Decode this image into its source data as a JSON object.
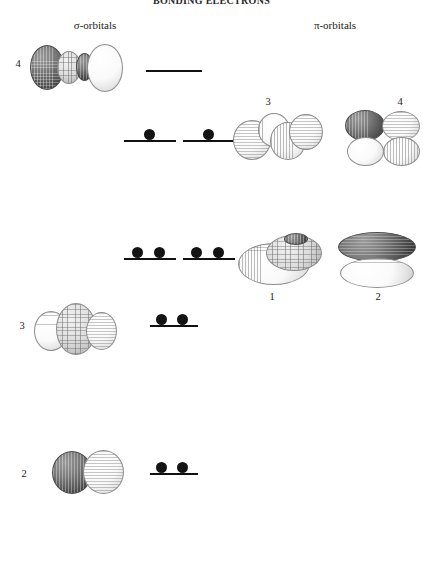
{
  "title": "BONDING ELECTRONS",
  "background_color": "#ffffff",
  "columns": {
    "sigma": {
      "header": "σ-orbitals"
    },
    "pi": {
      "header": "π-orbitals"
    }
  },
  "colors": {
    "line": "#111111",
    "electron": "#141414",
    "lobe_light": "#ffffff",
    "lobe_dark": "#565656",
    "text": "#1a1a1a"
  },
  "sigma_orbitals": [
    {
      "label": "4",
      "lobes": 4,
      "phases": [
        "dark",
        "light",
        "dark",
        "light"
      ],
      "electrons": 0,
      "level_filled": false,
      "row": 1
    },
    {
      "label": "3",
      "lobes": 3,
      "phases": [
        "light",
        "light",
        "light"
      ],
      "electrons": 2,
      "level_filled": true,
      "row": 3
    },
    {
      "label": "2",
      "lobes": 2,
      "phases": [
        "dark",
        "light"
      ],
      "electrons": 2,
      "level_filled": true,
      "row": 4
    }
  ],
  "pi_orbitals": [
    {
      "label": "3",
      "lobes": 4,
      "phases": [
        "light",
        "light",
        "light",
        "light"
      ],
      "electrons": 1,
      "level_filled": false,
      "row": 2
    },
    {
      "label": "4",
      "lobes": 4,
      "phases": [
        "dark",
        "light",
        "light",
        "light"
      ],
      "electrons": 1,
      "level_filled": false,
      "row": 2
    },
    {
      "label": "1",
      "lobes": 2,
      "phases": [
        "light",
        "light"
      ],
      "electrons": 2,
      "level_filled": true,
      "row": 3
    },
    {
      "label": "2",
      "lobes": 2,
      "phases": [
        "dark",
        "light"
      ],
      "electrons": 2,
      "level_filled": true,
      "row": 3
    }
  ],
  "energy_levels": [
    {
      "name": "sigma-star-4-level",
      "row": 1,
      "electrons": 0,
      "degenerate_group": "single"
    },
    {
      "name": "pi-star-level-a",
      "row": 2,
      "electrons": 1,
      "degenerate_group": "pair"
    },
    {
      "name": "pi-star-level-b",
      "row": 2,
      "electrons": 1,
      "degenerate_group": "pair"
    },
    {
      "name": "pi-level-a",
      "row": 3,
      "electrons": 2,
      "degenerate_group": "pair"
    },
    {
      "name": "pi-level-b",
      "row": 3,
      "electrons": 2,
      "degenerate_group": "pair"
    },
    {
      "name": "sigma-3-level",
      "row": 4,
      "electrons": 2,
      "degenerate_group": "single"
    },
    {
      "name": "sigma-2-level",
      "row": 5,
      "electrons": 2,
      "degenerate_group": "single"
    }
  ]
}
